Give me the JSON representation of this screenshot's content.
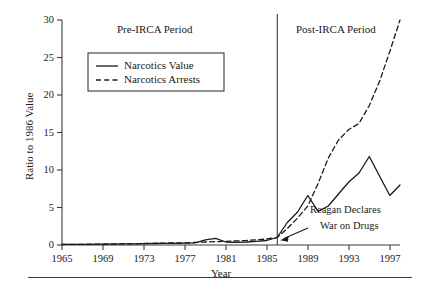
{
  "chart_data": {
    "type": "line",
    "title": "",
    "xlabel": "Year",
    "ylabel": "Ratio to 1986 Value",
    "xlim": [
      1965,
      1998
    ],
    "ylim": [
      0,
      30
    ],
    "grid": false,
    "legend_position": "upper-left-inside",
    "xticks": [
      1965,
      1969,
      1973,
      1977,
      1981,
      1985,
      1989,
      1993,
      1997
    ],
    "yticks": [
      0,
      5,
      10,
      15,
      20,
      25,
      30
    ],
    "x": [
      1965,
      1966,
      1967,
      1968,
      1969,
      1970,
      1971,
      1972,
      1973,
      1974,
      1975,
      1976,
      1977,
      1978,
      1979,
      1980,
      1981,
      1982,
      1983,
      1984,
      1985,
      1986,
      1987,
      1988,
      1989,
      1990,
      1991,
      1992,
      1993,
      1994,
      1995,
      1996,
      1997,
      1998
    ],
    "series": [
      {
        "name": "Narcotics Value",
        "style": "solid",
        "color": "#1a1a1a",
        "values": [
          0.1,
          0.1,
          0.1,
          0.1,
          0.12,
          0.12,
          0.15,
          0.15,
          0.18,
          0.2,
          0.22,
          0.22,
          0.25,
          0.3,
          0.7,
          0.9,
          0.4,
          0.35,
          0.4,
          0.5,
          0.6,
          1.0,
          3.0,
          4.4,
          6.6,
          4.5,
          5.2,
          6.8,
          8.4,
          9.6,
          11.8,
          9.2,
          6.6,
          8.0
        ]
      },
      {
        "name": "Narcotics Arrests",
        "style": "dashed",
        "color": "#1a1a1a",
        "values": [
          0.1,
          0.1,
          0.1,
          0.12,
          0.12,
          0.15,
          0.15,
          0.18,
          0.2,
          0.22,
          0.25,
          0.28,
          0.3,
          0.35,
          0.4,
          0.45,
          0.5,
          0.55,
          0.6,
          0.7,
          0.8,
          1.0,
          2.2,
          3.6,
          5.2,
          8.2,
          11.6,
          14.0,
          15.4,
          16.2,
          18.6,
          21.8,
          25.8,
          30.0
        ]
      }
    ],
    "annotations": [
      {
        "name": "reagan-annotation",
        "text_lines": [
          "Reagan Declares",
          "War on Drugs"
        ],
        "points_to_year": 1986,
        "points_to_value": 0.9
      },
      {
        "name": "pre-irca-period",
        "text": "Pre-IRCA Period"
      },
      {
        "name": "post-irca-period",
        "text": "Post-IRCA Period"
      }
    ],
    "vertical_divider": {
      "year": 1986,
      "label": "IRCA"
    }
  },
  "axes": {
    "y_title": "Ratio to 1986 Value",
    "x_title": "Year",
    "y_ticks": [
      "30",
      "25",
      "20",
      "15",
      "10",
      "5",
      "0"
    ],
    "x_ticks": [
      "1965",
      "1969",
      "1973",
      "1977",
      "1981",
      "1985",
      "1989",
      "1993",
      "1997"
    ]
  },
  "legend": {
    "items": [
      {
        "label": "Narcotics Value",
        "style": "solid"
      },
      {
        "label": "Narcotics Arrests",
        "style": "dashed"
      }
    ]
  },
  "periods": {
    "pre": "Pre-IRCA Period",
    "post": "Post-IRCA Period"
  },
  "annotation": {
    "line1": "Reagan Declares",
    "line2": "War on Drugs"
  },
  "colors": {
    "ink": "#1a1a1a",
    "axis": "#3a3a3a",
    "background": "#ffffff"
  }
}
